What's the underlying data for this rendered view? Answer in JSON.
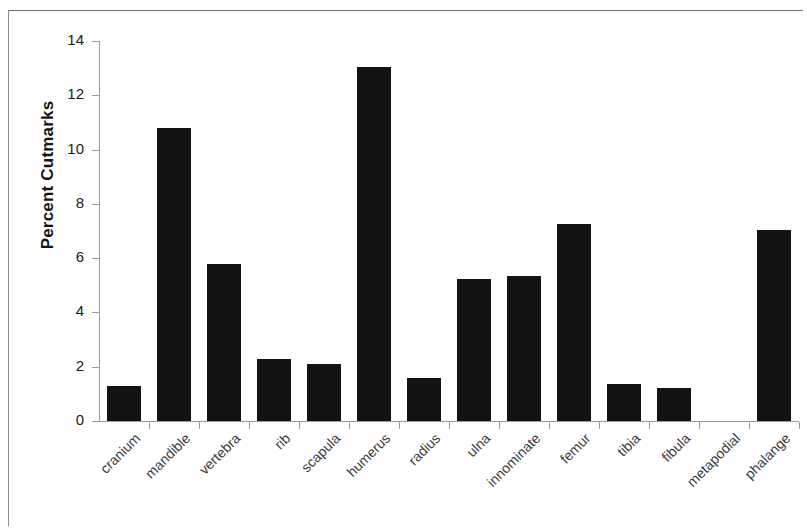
{
  "chart_data": {
    "type": "bar",
    "title": "",
    "subtitle": "",
    "xlabel": "",
    "ylabel": "Percent Cutmarks",
    "categories": [
      "cranium",
      "mandible",
      "vertebra",
      "rib",
      "scapula",
      "humerus",
      "radius",
      "ulna",
      "innominate",
      "femur",
      "tibia",
      "fibula",
      "metapodial",
      "phalange"
    ],
    "values": [
      1.3,
      10.8,
      5.8,
      2.3,
      2.1,
      13.05,
      1.6,
      5.25,
      5.35,
      7.25,
      1.35,
      1.2,
      0,
      7.05
    ],
    "ylim": [
      0,
      14
    ],
    "ytick_labels": [
      "0",
      "2",
      "4",
      "6",
      "8",
      "10",
      "12",
      "14"
    ],
    "ytick_values": [
      0,
      2,
      4,
      6,
      8,
      10,
      12,
      14
    ],
    "grid": false,
    "legend": false,
    "legend_position": "none",
    "bar_color": "#131313",
    "axis_color": "#9a9a9a",
    "text_color": "#1a1a1a",
    "label_rotation_degrees": -45
  }
}
